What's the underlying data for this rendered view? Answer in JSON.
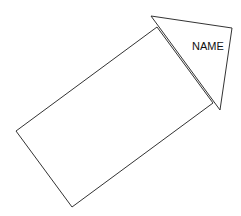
{
  "diagram": {
    "type": "arrow-shape",
    "stroke_color": "#333333",
    "fill_color": "#ffffff",
    "background": "#ffffff",
    "body": {
      "shape": "rotated-rectangle",
      "points": [
        [
          16,
          131
        ],
        [
          157,
          27
        ],
        [
          213,
          103
        ],
        [
          72,
          207
        ]
      ]
    },
    "head": {
      "shape": "triangle",
      "points": [
        [
          151,
          16
        ],
        [
          232,
          28
        ],
        [
          220,
          110
        ]
      ],
      "label": "NAME"
    }
  }
}
